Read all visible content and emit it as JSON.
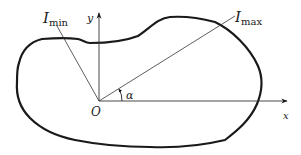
{
  "diagram": {
    "type": "cross-section principal axes",
    "labels": {
      "I_min_main": "I",
      "I_min_sub": "min",
      "I_max_main": "I",
      "I_max_sub": "max",
      "y_axis": "y",
      "x_axis": "x",
      "origin": "O",
      "angle": "α"
    },
    "colors": {
      "outline": "#1a1a1a",
      "axes": "#333333",
      "text": "#222222",
      "background": "#ffffff"
    }
  }
}
